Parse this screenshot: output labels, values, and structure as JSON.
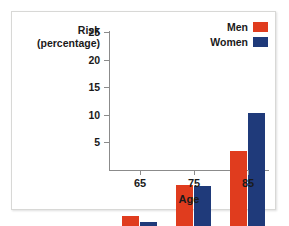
{
  "chart_data": {
    "type": "bar",
    "title": "",
    "xlabel": "Age",
    "ylabel": "Risk (percentage)",
    "ylabel_line1": "Risk",
    "ylabel_line2": "(percentage)",
    "categories": [
      "65",
      "75",
      "85"
    ],
    "yticks": [
      5,
      10,
      15,
      20,
      25
    ],
    "ylim": [
      0,
      26
    ],
    "grid": false,
    "legend_position": "top-right",
    "series": [
      {
        "name": "Men",
        "color": "#e03c1e",
        "values": [
          1.8,
          7.4,
          13.5
        ]
      },
      {
        "name": "Women",
        "color": "#1f3a7a",
        "values": [
          0.8,
          7.3,
          20.5
        ]
      }
    ]
  },
  "legend": {
    "items": [
      {
        "label": "Men",
        "color": "#e03c1e"
      },
      {
        "label": "Women",
        "color": "#1f3a7a"
      }
    ]
  },
  "axes": {
    "y_title_line1": "Risk",
    "y_title_line2": "(percentage)",
    "x_title": "Age",
    "y_tick_labels": [
      "25",
      "20",
      "15",
      "10",
      "5"
    ],
    "x_tick_labels": [
      "65",
      "75",
      "85"
    ]
  },
  "colors": {
    "men": "#e03c1e",
    "women": "#1f3a7a",
    "axis": "#8b8b8b",
    "text": "#1a1a1a",
    "background": "#ffffff",
    "frame": "#d8d8d6"
  }
}
